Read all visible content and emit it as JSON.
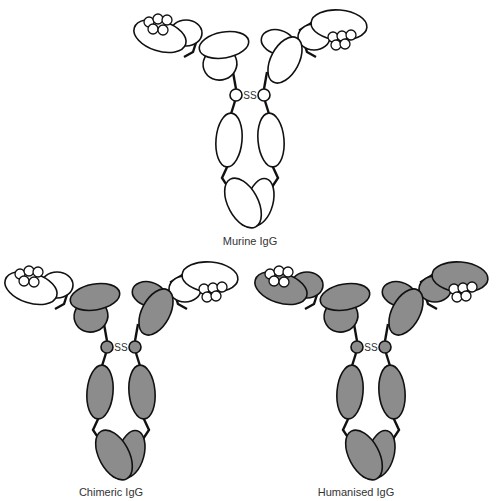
{
  "colors": {
    "murine": "#ffffff",
    "human": "#8c8c8c",
    "stroke": "#111111"
  },
  "disulfide_label": "SS",
  "antibodies": [
    {
      "name": "Murine IgG",
      "label": "Murine IgG",
      "variable_regions": "murine",
      "constant_regions": "murine",
      "framework": "murine",
      "cdr_loops": "murine"
    },
    {
      "name": "Chimeric IgG",
      "label": "Chimeric IgG",
      "variable_regions": "murine",
      "constant_regions": "human",
      "framework": "murine",
      "cdr_loops": "murine"
    },
    {
      "name": "Humanised IgG",
      "label": "Humanised IgG",
      "variable_regions": "human",
      "constant_regions": "human",
      "framework": "human",
      "cdr_loops": "murine"
    }
  ]
}
